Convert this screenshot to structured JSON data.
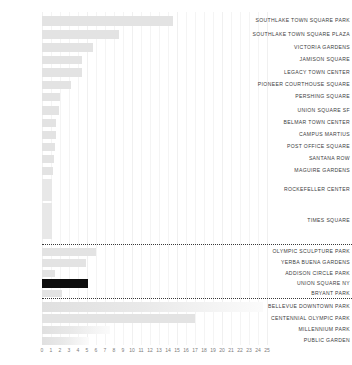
{
  "chart_data": {
    "type": "bar",
    "orientation": "horizontal",
    "title": "",
    "xlabel": "",
    "ylabel": "",
    "xlim": [
      0,
      25
    ],
    "grid": true,
    "legend": "none",
    "highlight_color": "#0d0d0d",
    "bar_color": "#e3e3e3",
    "ticks": [
      "0",
      "1",
      "2",
      "3",
      "4",
      "5",
      "6",
      "7",
      "8",
      "9",
      "10",
      "11",
      "12",
      "13",
      "14",
      "15",
      "16",
      "17",
      "18",
      "19",
      "20",
      "21",
      "22",
      "23",
      "24",
      "25"
    ],
    "categories": [
      "SOUTHLAKE TOWN SQUARE PARK",
      "SOUTHLAKE TOWN SQUARE PLAZA",
      "VICTORIA GARDENS",
      "JAMISON SQUARE",
      "LEGACY TOWN CENTER",
      "PIONEER COURTHOUSE SQUARE",
      "PERSHING SQUARE",
      "UNION SQUARE SF",
      "BELMAR TOWN CENTER",
      "CAMPUS MARTIUS",
      "POST OFFICE SQUARE",
      "SANTANA ROW",
      "MAGUIRE GARDENS",
      "ROCKEFELLER CENTER",
      "TIMES SQUARE",
      "OLYMPIC SCULPTURE PARK",
      "YERBA BUENA GARDENS",
      "ADDISON CIRCLE PARK",
      "UNION SQUARE NY",
      "BRYANT PARK",
      "BELLEVUE DOWNTOWN PARK",
      "CENTENNIAL OLYMPIC PARK",
      "MILLENNIUM PARK",
      "PUBLIC GARDEN"
    ],
    "values": [
      14.5,
      8.5,
      5.7,
      4.4,
      4.4,
      3.2,
      2.0,
      1.9,
      1.6,
      1.5,
      1.4,
      1.3,
      1.2,
      1.1,
      1.1,
      6.0,
      4.9,
      1.4,
      5.1,
      2.2,
      24.5,
      17.0,
      7.6,
      5.2
    ],
    "series": [
      {
        "name": "area",
        "values": [
          14.5,
          8.5,
          5.7,
          4.4,
          4.4,
          3.2,
          2.0,
          1.9,
          1.6,
          1.5,
          1.4,
          1.3,
          1.2,
          1.1,
          1.1,
          6.0,
          4.9,
          1.4,
          5.1,
          2.2,
          24.5,
          17.0,
          7.6,
          5.2
        ]
      }
    ],
    "highlighted_categories": [
      "UNION SQUARE NY"
    ],
    "group_separators_after": [
      "TIMES SQUARE",
      "BRYANT PARK"
    ]
  }
}
